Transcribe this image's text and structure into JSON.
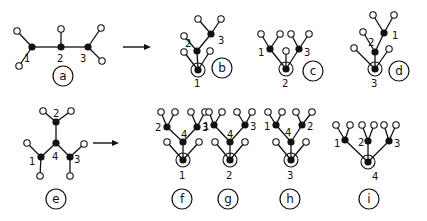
{
  "diagram": {
    "arrows": [
      {
        "from": "a",
        "to": "b-d",
        "x1": 123,
        "x2": 151,
        "y": 47
      },
      {
        "from": "e",
        "to": "f-i",
        "x1": 93,
        "x2": 119,
        "y": 143
      }
    ],
    "panels": [
      {
        "id": "a",
        "label": "a",
        "label_pos": [
          63,
          76
        ],
        "root": null,
        "nodes": [
          {
            "name": "1",
            "x": 32,
            "y": 47,
            "lx": 24,
            "ly": 62
          },
          {
            "name": "2",
            "x": 61,
            "y": 47,
            "lx": 57,
            "ly": 62
          },
          {
            "name": "3",
            "x": 88,
            "y": 47,
            "lx": 80,
            "ly": 62
          }
        ],
        "edges": [
          [
            32,
            47,
            61,
            47
          ],
          [
            61,
            47,
            88,
            47
          ]
        ],
        "leaves": [
          [
            17,
            31,
            32,
            47
          ],
          [
            19,
            66,
            32,
            47
          ],
          [
            61,
            29,
            61,
            47
          ],
          [
            101,
            28,
            88,
            47
          ],
          [
            102,
            61,
            88,
            47
          ]
        ]
      },
      {
        "id": "b",
        "label": "b",
        "label_pos": [
          222,
          68
        ],
        "root": {
          "x": 198,
          "y": 70
        },
        "nodes": [
          {
            "name": "1",
            "x": 198,
            "y": 70,
            "lx": 194,
            "ly": 87
          },
          {
            "name": "2",
            "x": 197,
            "y": 51,
            "lx": 185,
            "ly": 47
          },
          {
            "name": "3",
            "x": 211,
            "y": 34,
            "lx": 218,
            "ly": 44
          }
        ],
        "edges": [
          [
            198,
            70,
            197,
            51
          ],
          [
            197,
            51,
            211,
            34
          ]
        ],
        "leaves": [
          [
            184,
            52,
            198,
            70
          ],
          [
            210,
            51,
            198,
            70
          ],
          [
            184,
            36,
            197,
            51
          ],
          [
            198,
            19,
            211,
            34
          ],
          [
            221,
            19,
            211,
            34
          ]
        ]
      },
      {
        "id": "c",
        "label": "c",
        "label_pos": [
          313,
          71
        ],
        "root": {
          "x": 286,
          "y": 69
        },
        "nodes": [
          {
            "name": "2",
            "x": 286,
            "y": 69,
            "lx": 282,
            "ly": 87
          },
          {
            "name": "1",
            "x": 270,
            "y": 49,
            "lx": 258,
            "ly": 56
          },
          {
            "name": "3",
            "x": 299,
            "y": 49,
            "lx": 304,
            "ly": 56
          }
        ],
        "edges": [
          [
            286,
            69,
            270,
            49
          ],
          [
            286,
            69,
            299,
            49
          ]
        ],
        "leaves": [
          [
            286,
            51,
            286,
            69
          ],
          [
            261,
            34,
            270,
            49
          ],
          [
            280,
            34,
            270,
            49
          ],
          [
            291,
            34,
            299,
            49
          ],
          [
            309,
            34,
            299,
            49
          ]
        ]
      },
      {
        "id": "d",
        "label": "d",
        "label_pos": [
          399,
          71
        ],
        "root": {
          "x": 375,
          "y": 69
        },
        "nodes": [
          {
            "name": "3",
            "x": 375,
            "y": 69,
            "lx": 371,
            "ly": 87
          },
          {
            "name": "2",
            "x": 375,
            "y": 52,
            "lx": 368,
            "ly": 46
          },
          {
            "name": "1",
            "x": 384,
            "y": 33,
            "lx": 392,
            "ly": 39
          }
        ],
        "edges": [
          [
            375,
            69,
            375,
            52
          ],
          [
            375,
            52,
            384,
            33
          ]
        ],
        "leaves": [
          [
            354,
            48,
            375,
            69
          ],
          [
            389,
            49,
            375,
            69
          ],
          [
            363,
            32,
            375,
            52
          ],
          [
            373,
            15,
            384,
            33
          ],
          [
            394,
            15,
            384,
            33
          ]
        ]
      },
      {
        "id": "e",
        "label": "e",
        "label_pos": [
          56,
          199
        ],
        "root": null,
        "nodes": [
          {
            "name": "4",
            "x": 56,
            "y": 143,
            "lx": 52,
            "ly": 160
          },
          {
            "name": "2",
            "x": 56,
            "y": 122,
            "lx": 53,
            "ly": 117
          },
          {
            "name": "1",
            "x": 41,
            "y": 157,
            "lx": 29,
            "ly": 165
          },
          {
            "name": "3",
            "x": 70,
            "y": 157,
            "lx": 74,
            "ly": 163
          }
        ],
        "edges": [
          [
            56,
            143,
            56,
            122
          ],
          [
            56,
            143,
            41,
            157
          ],
          [
            56,
            143,
            70,
            157
          ]
        ],
        "leaves": [
          [
            43,
            111,
            56,
            122
          ],
          [
            71,
            111,
            56,
            122
          ],
          [
            27,
            143,
            41,
            157
          ],
          [
            40,
            176,
            41,
            157
          ],
          [
            84,
            144,
            70,
            157
          ],
          [
            70,
            176,
            70,
            157
          ]
        ]
      },
      {
        "id": "f",
        "label": "f",
        "label_pos": [
          182,
          199
        ],
        "root": {
          "x": 183,
          "y": 160
        },
        "nodes": [
          {
            "name": "1",
            "x": 183,
            "y": 160,
            "lx": 179,
            "ly": 179
          },
          {
            "name": "4",
            "x": 183,
            "y": 142,
            "lx": 181,
            "ly": 138
          },
          {
            "name": "2",
            "x": 167,
            "y": 127,
            "lx": 155,
            "ly": 131
          },
          {
            "name": "3",
            "x": 197,
            "y": 127,
            "lx": 202,
            "ly": 131
          }
        ],
        "edges": [
          [
            183,
            160,
            183,
            142
          ],
          [
            183,
            142,
            167,
            127
          ],
          [
            183,
            142,
            197,
            127
          ]
        ],
        "leaves": [
          [
            167,
            142,
            183,
            160
          ],
          [
            199,
            142,
            183,
            160
          ],
          [
            161,
            112,
            167,
            127
          ],
          [
            175,
            112,
            167,
            127
          ],
          [
            191,
            112,
            197,
            127
          ],
          [
            205,
            112,
            197,
            127
          ]
        ]
      },
      {
        "id": "g",
        "label": "g",
        "label_pos": [
          228,
          199
        ],
        "root": {
          "x": 230,
          "y": 160
        },
        "nodes": [
          {
            "name": "2",
            "x": 230,
            "y": 160,
            "lx": 226,
            "ly": 179
          },
          {
            "name": "4",
            "x": 230,
            "y": 142,
            "lx": 227,
            "ly": 138
          },
          {
            "name": "1",
            "x": 214,
            "y": 125,
            "lx": 203,
            "ly": 130
          },
          {
            "name": "3",
            "x": 245,
            "y": 125,
            "lx": 250,
            "ly": 130
          }
        ],
        "edges": [
          [
            230,
            160,
            230,
            142
          ],
          [
            230,
            142,
            214,
            125
          ],
          [
            230,
            142,
            245,
            125
          ]
        ],
        "leaves": [
          [
            215,
            142,
            230,
            160
          ],
          [
            245,
            142,
            230,
            160
          ],
          [
            209,
            112,
            214,
            125
          ],
          [
            222,
            112,
            214,
            125
          ],
          [
            237,
            112,
            245,
            125
          ],
          [
            252,
            112,
            245,
            125
          ]
        ]
      },
      {
        "id": "h",
        "label": "h",
        "label_pos": [
          290,
          199
        ],
        "root": {
          "x": 291,
          "y": 160
        },
        "nodes": [
          {
            "name": "3",
            "x": 291,
            "y": 160,
            "lx": 287,
            "ly": 179
          },
          {
            "name": "4",
            "x": 291,
            "y": 142,
            "lx": 285,
            "ly": 136
          },
          {
            "name": "1",
            "x": 276,
            "y": 125,
            "lx": 264,
            "ly": 130
          },
          {
            "name": "2",
            "x": 302,
            "y": 125,
            "lx": 307,
            "ly": 130
          }
        ],
        "edges": [
          [
            291,
            160,
            291,
            142
          ],
          [
            291,
            142,
            276,
            125
          ],
          [
            291,
            142,
            302,
            125
          ]
        ],
        "leaves": [
          [
            276,
            142,
            291,
            160
          ],
          [
            306,
            142,
            291,
            160
          ],
          [
            268,
            112,
            276,
            125
          ],
          [
            282,
            112,
            276,
            125
          ],
          [
            296,
            112,
            302,
            125
          ],
          [
            312,
            112,
            302,
            125
          ]
        ]
      },
      {
        "id": "i",
        "label": "i",
        "label_pos": [
          369,
          199
        ],
        "root": {
          "x": 368,
          "y": 162
        },
        "nodes": [
          {
            "name": "4",
            "x": 368,
            "y": 162,
            "lx": 372,
            "ly": 180
          },
          {
            "name": "1",
            "x": 345,
            "y": 140,
            "lx": 334,
            "ly": 147
          },
          {
            "name": "2",
            "x": 368,
            "y": 141,
            "lx": 358,
            "ly": 146
          },
          {
            "name": "3",
            "x": 389,
            "y": 141,
            "lx": 394,
            "ly": 147
          }
        ],
        "edges": [
          [
            368,
            162,
            345,
            140
          ],
          [
            368,
            162,
            368,
            141
          ],
          [
            368,
            162,
            389,
            141
          ]
        ],
        "leaves": [
          [
            336,
            125,
            345,
            140
          ],
          [
            350,
            125,
            345,
            140
          ],
          [
            362,
            125,
            368,
            141
          ],
          [
            374,
            125,
            368,
            141
          ],
          [
            384,
            125,
            389,
            141
          ],
          [
            396,
            125,
            389,
            141
          ]
        ]
      }
    ]
  }
}
